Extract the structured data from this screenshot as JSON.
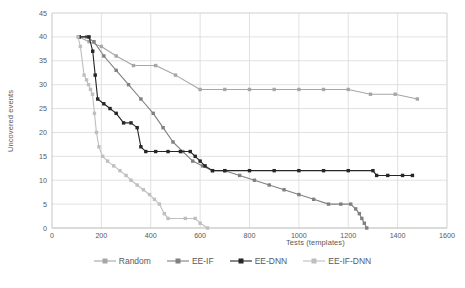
{
  "chart_data": {
    "type": "line",
    "title": "",
    "xlabel": "Tests (templates)",
    "ylabel": "Uncovered events",
    "xlim": [
      0,
      1600
    ],
    "ylim": [
      0,
      45
    ],
    "xticks": [
      0,
      200,
      400,
      600,
      800,
      1000,
      1200,
      1400,
      1600
    ],
    "yticks": [
      0,
      5,
      10,
      15,
      20,
      25,
      30,
      35,
      40,
      45
    ],
    "grid": true,
    "legend_position": "bottom",
    "series": [
      {
        "name": "Random",
        "color": "#A6A6A6",
        "points": [
          [
            110,
            40
          ],
          [
            150,
            39
          ],
          [
            200,
            38
          ],
          [
            260,
            36
          ],
          [
            330,
            34
          ],
          [
            420,
            34
          ],
          [
            500,
            32
          ],
          [
            600,
            29
          ],
          [
            700,
            29
          ],
          [
            800,
            29
          ],
          [
            900,
            29
          ],
          [
            1000,
            29
          ],
          [
            1100,
            29
          ],
          [
            1200,
            29
          ],
          [
            1290,
            28
          ],
          [
            1390,
            28
          ],
          [
            1480,
            27
          ]
        ]
      },
      {
        "name": "EE-IF",
        "color": "#808080",
        "points": [
          [
            110,
            40
          ],
          [
            140,
            40
          ],
          [
            170,
            39
          ],
          [
            210,
            36
          ],
          [
            260,
            33
          ],
          [
            310,
            30
          ],
          [
            360,
            27
          ],
          [
            410,
            24
          ],
          [
            450,
            21
          ],
          [
            490,
            18
          ],
          [
            530,
            16
          ],
          [
            570,
            14
          ],
          [
            610,
            13
          ],
          [
            650,
            12
          ],
          [
            700,
            12
          ],
          [
            760,
            11
          ],
          [
            820,
            10
          ],
          [
            880,
            9
          ],
          [
            940,
            8
          ],
          [
            1000,
            7
          ],
          [
            1060,
            6
          ],
          [
            1120,
            5
          ],
          [
            1170,
            5
          ],
          [
            1210,
            5
          ],
          [
            1230,
            4
          ],
          [
            1245,
            3
          ],
          [
            1255,
            2
          ],
          [
            1265,
            1
          ],
          [
            1275,
            0
          ]
        ]
      },
      {
        "name": "EE-DNN",
        "color": "#262626",
        "points": [
          [
            110,
            40
          ],
          [
            150,
            40
          ],
          [
            165,
            37
          ],
          [
            175,
            32
          ],
          [
            185,
            27
          ],
          [
            210,
            26
          ],
          [
            235,
            25
          ],
          [
            260,
            24
          ],
          [
            290,
            22
          ],
          [
            320,
            22
          ],
          [
            345,
            21
          ],
          [
            360,
            17
          ],
          [
            380,
            16
          ],
          [
            420,
            16
          ],
          [
            470,
            16
          ],
          [
            520,
            16
          ],
          [
            560,
            16
          ],
          [
            580,
            15
          ],
          [
            600,
            14
          ],
          [
            620,
            13
          ],
          [
            650,
            12
          ],
          [
            700,
            12
          ],
          [
            800,
            12
          ],
          [
            900,
            12
          ],
          [
            1000,
            12
          ],
          [
            1100,
            12
          ],
          [
            1200,
            12
          ],
          [
            1300,
            12
          ],
          [
            1315,
            11
          ],
          [
            1360,
            11
          ],
          [
            1420,
            11
          ],
          [
            1460,
            11
          ]
        ]
      },
      {
        "name": "EE-IF-DNN",
        "color": "#BFBFBF",
        "points": [
          [
            105,
            40
          ],
          [
            115,
            38
          ],
          [
            130,
            32
          ],
          [
            140,
            31
          ],
          [
            148,
            30
          ],
          [
            156,
            29
          ],
          [
            164,
            28
          ],
          [
            172,
            24
          ],
          [
            180,
            20
          ],
          [
            190,
            17
          ],
          [
            205,
            15
          ],
          [
            225,
            14
          ],
          [
            250,
            13
          ],
          [
            275,
            12
          ],
          [
            300,
            11
          ],
          [
            320,
            10
          ],
          [
            345,
            9
          ],
          [
            370,
            8
          ],
          [
            395,
            7
          ],
          [
            415,
            6
          ],
          [
            435,
            5
          ],
          [
            455,
            3
          ],
          [
            470,
            2
          ],
          [
            540,
            2
          ],
          [
            580,
            2
          ],
          [
            600,
            1
          ],
          [
            630,
            0
          ]
        ]
      }
    ]
  },
  "legend": {
    "items": [
      {
        "label": "Random"
      },
      {
        "label": "EE-IF"
      },
      {
        "label": "EE-DNN"
      },
      {
        "label": "EE-IF-DNN"
      }
    ]
  },
  "axes": {
    "x_title": "Tests (templates)",
    "y_title": "Uncovered events"
  },
  "colors": {
    "random": "#A6A6A6",
    "ee_if": "#808080",
    "ee_dnn": "#262626",
    "ee_if_dnn": "#BFBFBF",
    "grid": "#D9D9D9",
    "axis_text": "#595959"
  }
}
